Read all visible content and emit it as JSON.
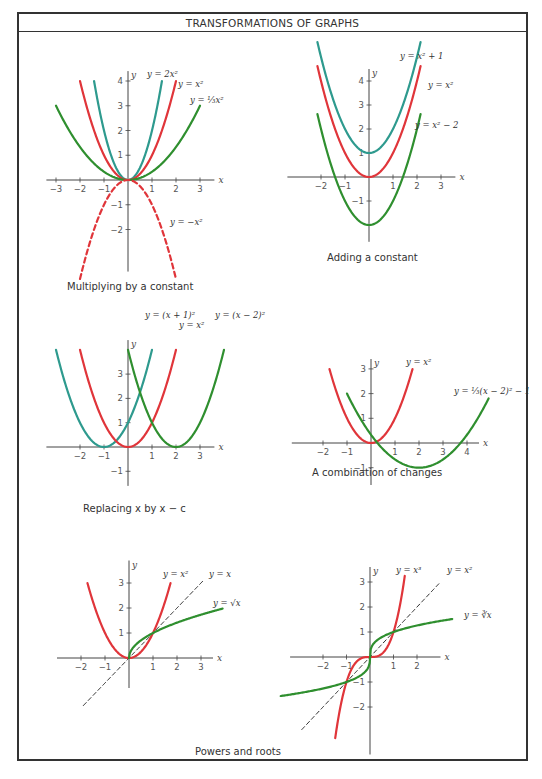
{
  "title": "TRANSFORMATIONS OF GRAPHS",
  "colors": {
    "red": "#e0353a",
    "teal": "#2e9a8e",
    "green": "#2f8f2f",
    "axis": "#444444",
    "dash": "#222222"
  },
  "panels": [
    {
      "id": "multiplying",
      "caption": "Multiplying by a constant",
      "caption_pos": [
        67,
        291
      ],
      "origin": [
        128,
        180
      ],
      "unit": [
        24,
        24.75
      ],
      "xrange": [
        -3.4,
        3.6
      ],
      "yrange": [
        -3.7,
        4.4
      ],
      "xticks": [
        -3,
        -2,
        -1,
        1,
        2,
        3
      ],
      "yticks": [
        -2,
        -1,
        1,
        2,
        3,
        4
      ],
      "curves": [
        {
          "label": "y = 2x²",
          "fn": "2*x*x",
          "from": -1.414,
          "to": 1.414,
          "color": "teal"
        },
        {
          "label": "y = x²",
          "fn": "x*x",
          "from": -2,
          "to": 2,
          "color": "red"
        },
        {
          "label": "y = (1/3)x²",
          "fn": "x*x/3",
          "from": -3,
          "to": 3,
          "color": "green"
        },
        {
          "label": "y = −x²",
          "fn": "-x*x",
          "from": -2,
          "to": 2,
          "color": "red",
          "dashed": true
        }
      ],
      "labels": [
        {
          "text": "y = 2x²",
          "x": 147,
          "y": 77
        },
        {
          "text": "y = x²",
          "x": 178,
          "y": 87
        },
        {
          "text": "y = ⅓x²",
          "x": 190,
          "y": 103
        },
        {
          "text": "y = −x²",
          "x": 170,
          "y": 225
        }
      ]
    },
    {
      "id": "adding",
      "caption": "Adding a constant",
      "caption_pos": [
        327,
        262
      ],
      "origin": [
        369,
        177
      ],
      "unit": [
        24,
        24
      ],
      "xrange": [
        -3.4,
        3.6
      ],
      "yrange": [
        -2.7,
        4.5
      ],
      "xticks": [
        -2,
        -1,
        1,
        2,
        3
      ],
      "yticks": [
        -1,
        1,
        2,
        3,
        4
      ],
      "curves": [
        {
          "label": "y = x² + 1",
          "fn": "x*x+1",
          "from": -2.15,
          "to": 2.15,
          "color": "teal"
        },
        {
          "label": "y = x²",
          "fn": "x*x",
          "from": -2.15,
          "to": 2.15,
          "color": "red"
        },
        {
          "label": "y = x² − 2",
          "fn": "x*x-2",
          "from": -2.15,
          "to": 2.15,
          "color": "green"
        }
      ],
      "labels": [
        {
          "text": "y = x² + 1",
          "x": 400,
          "y": 59
        },
        {
          "text": "y = x²",
          "x": 428,
          "y": 88
        },
        {
          "text": "y = x² − 2",
          "x": 415,
          "y": 128
        }
      ]
    },
    {
      "id": "replacing",
      "caption": "Replacing x by x − c",
      "caption_pos": [
        83,
        513
      ],
      "origin": [
        128,
        447
      ],
      "unit": [
        24,
        24.3
      ],
      "xrange": [
        -3.4,
        3.6
      ],
      "yrange": [
        -1.6,
        4.4
      ],
      "xticks": [
        -2,
        -1,
        1,
        2,
        3
      ],
      "yticks": [
        -1,
        1,
        2,
        3
      ],
      "curves": [
        {
          "label": "y = (x + 1)²",
          "fn": "(x+1)*(x+1)",
          "from": -3,
          "to": 1,
          "color": "teal"
        },
        {
          "label": "y = x²",
          "fn": "x*x",
          "from": -2,
          "to": 2,
          "color": "red"
        },
        {
          "label": "y = (x − 2)²",
          "fn": "(x-2)*(x-2)",
          "from": 0,
          "to": 4,
          "color": "green"
        }
      ],
      "labels": [
        {
          "text": "y = (x + 1)²",
          "x": 145,
          "y": 318
        },
        {
          "text": "y = x²",
          "x": 179,
          "y": 328
        },
        {
          "text": "y = (x − 2)²",
          "x": 215,
          "y": 318
        }
      ]
    },
    {
      "id": "combination",
      "caption": "A combination of changes",
      "caption_pos": [
        312,
        477
      ],
      "origin": [
        371,
        443
      ],
      "unit": [
        24,
        24.7
      ],
      "xrange": [
        -3.3,
        4.5
      ],
      "yrange": [
        -1.7,
        3.4
      ],
      "xticks": [
        -2,
        -1,
        1,
        2,
        3,
        4
      ],
      "yticks": [
        -1,
        1,
        2,
        3
      ],
      "curves": [
        {
          "label": "y = x²",
          "fn": "x*x",
          "from": -1.73,
          "to": 1.73,
          "color": "red"
        },
        {
          "label": "y = (1/3)(x − 2)² − 1",
          "fn": "(x-2)*(x-2)/3-1",
          "from": -1,
          "to": 4.9,
          "color": "green"
        }
      ],
      "labels": [
        {
          "text": "y = x²",
          "x": 406,
          "y": 365
        },
        {
          "text": "y = ⅓(x − 2)² − 1",
          "x": 454,
          "y": 394
        }
      ]
    },
    {
      "id": "powers-left",
      "caption": "",
      "origin": [
        129,
        658
      ],
      "unit": [
        24,
        25
      ],
      "xrange": [
        -3,
        3.5
      ],
      "yrange": [
        -1.2,
        3.9
      ],
      "xticks": [
        -2,
        -1,
        1,
        2,
        3
      ],
      "yticks": [
        1,
        2,
        3
      ],
      "curves": [
        {
          "label": "y = x²",
          "fn": "x*x",
          "from": -1.73,
          "to": 1.73,
          "color": "red"
        },
        {
          "label": "y = x",
          "fn": "x",
          "from": -1.9,
          "to": 3.1,
          "color": "dash",
          "dashed": true
        },
        {
          "label": "y = √x",
          "fn": "Math.sqrt(x)",
          "from": 0,
          "to": 3.9,
          "color": "green"
        }
      ],
      "labels": [
        {
          "text": "y = x²",
          "x": 163,
          "y": 577
        },
        {
          "text": "y = x",
          "x": 209,
          "y": 577
        },
        {
          "text": "y = √x",
          "x": 213,
          "y": 606
        }
      ]
    },
    {
      "id": "powers-right",
      "caption": "Powers and roots",
      "caption_pos": [
        195,
        756
      ],
      "origin": [
        370,
        657
      ],
      "unit": [
        23.5,
        25
      ],
      "xrange": [
        -3.4,
        3.0
      ],
      "yrange": [
        -3.9,
        3.6
      ],
      "xticks": [
        -2,
        -1,
        1,
        2
      ],
      "yticks": [
        -2,
        -1,
        1,
        2,
        3
      ],
      "curves": [
        {
          "label": "y = x³",
          "fn": "x*x*x",
          "from": -1.48,
          "to": 1.48,
          "color": "red"
        },
        {
          "label": "y = x",
          "fn": "x",
          "from": -2.9,
          "to": 3.0,
          "color": "dash",
          "dashed": true
        },
        {
          "label": "y = ∛x",
          "fn": "Math.cbrt(x)",
          "from": -3.8,
          "to": 3.5,
          "color": "green"
        }
      ],
      "labels": [
        {
          "text": "y = x³",
          "x": 396,
          "y": 573
        },
        {
          "text": "y = x²",
          "x": 447,
          "y": 573
        },
        {
          "text": "y = ∛x",
          "x": 464,
          "y": 618
        }
      ]
    }
  ]
}
